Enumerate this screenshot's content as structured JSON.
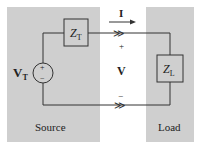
{
  "diagram": {
    "type": "circuit",
    "colors": {
      "background": "#ffffff",
      "region_fill": "#cfcfcf",
      "line": "#333333",
      "text": "#222222"
    },
    "source": {
      "label": "Source",
      "voltage_symbol": "V",
      "voltage_subscript": "T",
      "plus": "+",
      "minus": "−",
      "impedance_symbol": "Z",
      "impedance_subscript": "T"
    },
    "load": {
      "label": "Load",
      "impedance_symbol": "Z",
      "impedance_subscript": "L"
    },
    "middle": {
      "current_label": "I",
      "voltage_label": "V",
      "plus": "+",
      "minus": "−",
      "top_marker": "≫",
      "bottom_marker": "≫"
    }
  }
}
